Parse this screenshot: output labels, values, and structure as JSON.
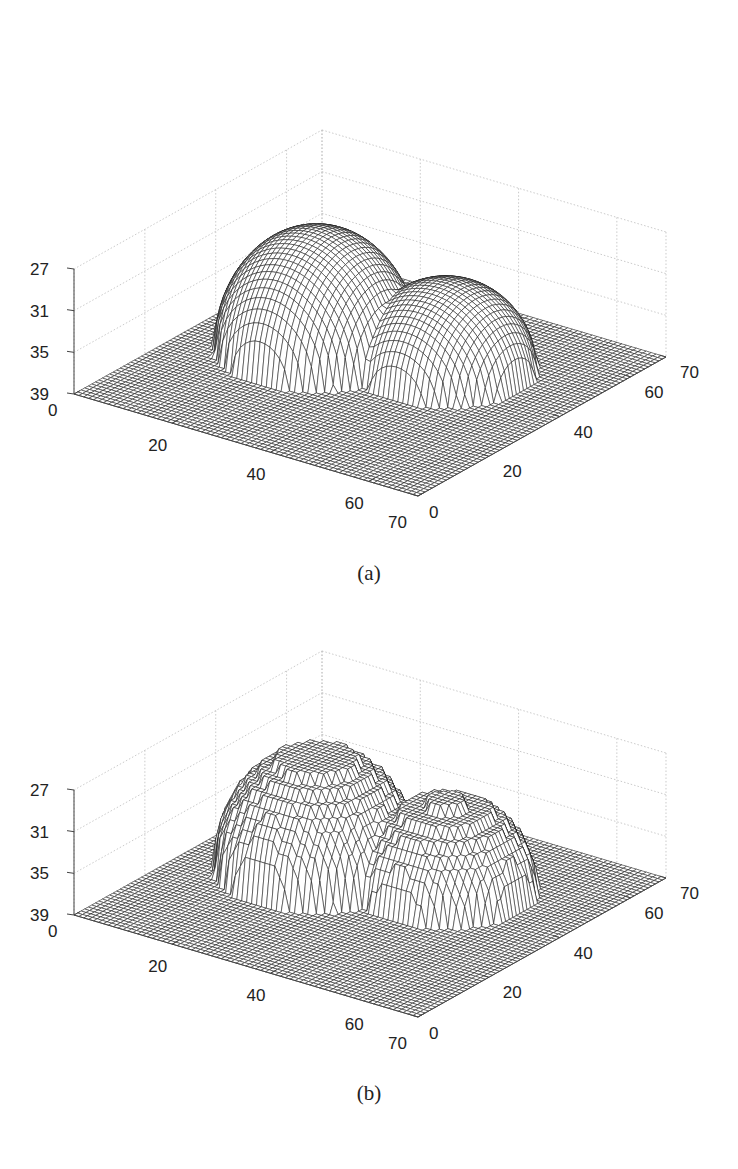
{
  "figure": {
    "panels": [
      {
        "id": "a",
        "caption": "(a)"
      },
      {
        "id": "b",
        "caption": "(b)"
      }
    ]
  },
  "chart_data": [
    {
      "type": "surface-mesh",
      "title": "",
      "caption": "(a)",
      "xlabel": "",
      "ylabel": "",
      "zlabel": "",
      "xlim": [
        0,
        70
      ],
      "ylim": [
        0,
        70
      ],
      "zlim": [
        27,
        39
      ],
      "z_reversed": true,
      "x_ticks": [
        0,
        20,
        40,
        60,
        70
      ],
      "y_ticks": [
        0,
        20,
        40,
        60,
        70
      ],
      "z_ticks": [
        27,
        31,
        35,
        39
      ],
      "grid": true,
      "grid_size": 70,
      "base_level": 39,
      "surface": "smooth",
      "domes": [
        {
          "cx": 22,
          "cy": 38,
          "radius": 17,
          "peak": 27.5
        },
        {
          "cx": 44,
          "cy": 44,
          "radius": 15,
          "peak": 30.6
        }
      ]
    },
    {
      "type": "surface-mesh",
      "title": "",
      "caption": "(b)",
      "xlabel": "",
      "ylabel": "",
      "zlabel": "",
      "xlim": [
        0,
        70
      ],
      "ylim": [
        0,
        70
      ],
      "zlim": [
        27,
        39
      ],
      "z_reversed": true,
      "x_ticks": [
        0,
        20,
        40,
        60,
        70
      ],
      "y_ticks": [
        0,
        20,
        40,
        60,
        70
      ],
      "z_ticks": [
        27,
        31,
        35,
        39
      ],
      "grid": true,
      "grid_size": 70,
      "base_level": 39,
      "surface": "terraced",
      "terrace_step": 1.0,
      "domes": [
        {
          "cx": 22,
          "cy": 38,
          "radius": 17,
          "peak": 28.0
        },
        {
          "cx": 44,
          "cy": 44,
          "radius": 15,
          "peak": 30.8
        }
      ]
    }
  ]
}
